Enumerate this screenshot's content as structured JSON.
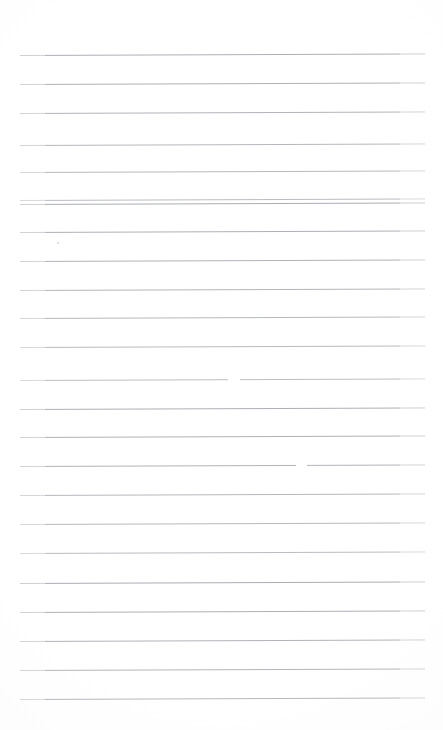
{
  "document": {
    "kind": "scanned-lined-paper",
    "title": "Blank ruled notebook page",
    "page_width": 443,
    "page_height": 730,
    "background_color": "#ffffff",
    "rule_color": "#a3a6ac",
    "rule_thickness_px": 1,
    "rule_left_x": 20,
    "rule_right_x": 425,
    "rule_slant_deg": -0.22,
    "rule_spacing_px": 28.8,
    "first_rule_y": 55,
    "rule_count": 23,
    "visible_text": "",
    "notes_text": "No handwriting or printed text is present on the page."
  },
  "rules": [
    {
      "index": 1,
      "y": 55
    },
    {
      "index": 2,
      "y": 84
    },
    {
      "index": 3,
      "y": 113
    },
    {
      "index": 4,
      "y": 145
    },
    {
      "index": 5,
      "y": 172
    },
    {
      "index": 6,
      "y": 200
    },
    {
      "index": 7,
      "y": 204
    },
    {
      "index": 8,
      "y": 232
    },
    {
      "index": 9,
      "y": 261
    },
    {
      "index": 10,
      "y": 290
    },
    {
      "index": 11,
      "y": 318
    },
    {
      "index": 12,
      "y": 347
    },
    {
      "index": 13,
      "y": 380
    },
    {
      "index": 14,
      "y": 409
    },
    {
      "index": 15,
      "y": 437
    },
    {
      "index": 16,
      "y": 466
    },
    {
      "index": 17,
      "y": 495
    },
    {
      "index": 18,
      "y": 524
    },
    {
      "index": 19,
      "y": 553
    },
    {
      "index": 20,
      "y": 583
    },
    {
      "index": 21,
      "y": 612
    },
    {
      "index": 22,
      "y": 641
    },
    {
      "index": 23,
      "y": 670
    },
    {
      "index": 24,
      "y": 699
    }
  ],
  "artifacts": {
    "line_gaps": [
      {
        "name": "gap-upper",
        "x": 228,
        "y": 379,
        "width": 12
      },
      {
        "name": "gap-lower",
        "x": 296,
        "y": 465,
        "width": 11
      }
    ],
    "specks": [
      {
        "name": "speck-left-margin",
        "x": 57,
        "y": 242,
        "size": 2
      }
    ]
  }
}
